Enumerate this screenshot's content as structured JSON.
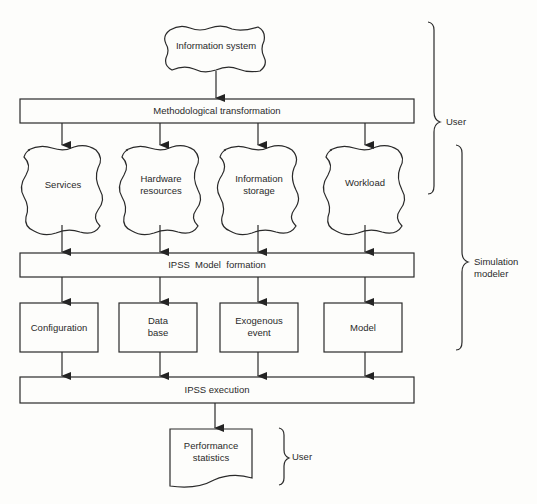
{
  "diagram": {
    "source": {
      "label": "Information system"
    },
    "bars": {
      "transformation": "Methodological transformation",
      "formation": "IPSS  Model  formation",
      "execution": "IPSS execution"
    },
    "clouds": [
      {
        "line1": "Services",
        "line2": ""
      },
      {
        "line1": "Hardware",
        "line2": "resources"
      },
      {
        "line1": "Information",
        "line2": "storage"
      },
      {
        "line1": "Workload",
        "line2": ""
      }
    ],
    "boxes": [
      {
        "line1": "Configuration",
        "line2": ""
      },
      {
        "line1": "Data",
        "line2": "base"
      },
      {
        "line1": "Exogenous",
        "line2": "event"
      },
      {
        "line1": "Model",
        "line2": ""
      }
    ],
    "output": {
      "line1": "Performance",
      "line2": "statistics"
    },
    "braces": {
      "top_user": "User",
      "modeler_line1": "Simulation",
      "modeler_line2": "modeler",
      "bottom_user": "User"
    }
  }
}
